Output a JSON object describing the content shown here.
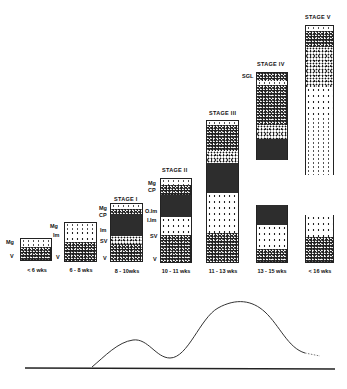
{
  "figure": {
    "columns": [
      {
        "age": "< 6 wks",
        "stage": "",
        "layers": [
          "Mg",
          "V"
        ]
      },
      {
        "age": "6 - 8 wks",
        "stage": "",
        "layers": [
          "Mg",
          "Im",
          "V"
        ]
      },
      {
        "age": "8 - 10wks",
        "stage": "STAGE I",
        "layers": [
          "Mg",
          "CP",
          "Im",
          "SV",
          "V"
        ]
      },
      {
        "age": "10 - 11 wks",
        "stage": "STAGE II",
        "layers": [
          "Mg",
          "CP",
          "O.Im",
          "I.Im",
          "SV",
          "V"
        ]
      },
      {
        "age": "11 - 13 wks",
        "stage": "STAGE III",
        "layers": []
      },
      {
        "age": "13 - 15 wks",
        "stage": "STAGE IV",
        "layers": [
          "SGL"
        ]
      },
      {
        "age": "< 16 wks",
        "stage": "STAGE V",
        "layers": []
      }
    ],
    "curve": {
      "description": "Bimodal curve beneath the columns with a smaller first peak and larger second peak, ending dotted",
      "baseline": true
    }
  },
  "labels": {
    "c1_mg": "Mg",
    "c1_v": "V",
    "c1_age": "< 6 wks",
    "c2_mg": "Mg",
    "c2_im": "Im",
    "c2_v": "V",
    "c2_age": "6 - 8 wks",
    "c3_stage": "STAGE I",
    "c3_mg": "Mg",
    "c3_cp": "CP",
    "c3_im": "Im",
    "c3_sv": "SV",
    "c3_v": "V",
    "c3_age": "8 - 10wks",
    "c4_stage": "STAGE II",
    "c4_mg": "Mg",
    "c4_cp": "CP",
    "c4_oim": "O.Im",
    "c4_iim": "I.Im",
    "c4_sv": "SV",
    "c4_v": "V",
    "c4_age": "10 - 11 wks",
    "c5_stage": "STAGE III",
    "c5_age": "11 - 13 wks",
    "c6_stage": "STAGE IV",
    "c6_sgl": "SGL",
    "c6_age": "13 - 15 wks",
    "c7_stage": "STAGE V",
    "c7_age": "< 16 wks"
  },
  "colors": {
    "ink": "#111111",
    "background": "#ffffff"
  }
}
